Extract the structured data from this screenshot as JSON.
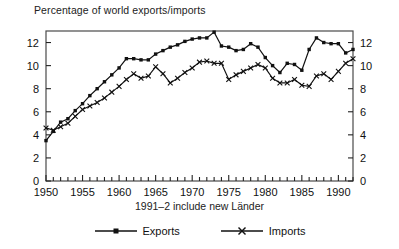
{
  "chart_data": {
    "type": "line",
    "title": "Percentage of world exports/imports",
    "subtitle": "1991–2 include new Länder",
    "xlabel": "",
    "ylabel": "",
    "xlim": [
      1950,
      1992
    ],
    "ylim": [
      0,
      13
    ],
    "grid": false,
    "legend_position": "bottom",
    "dual_y_axis": true,
    "x": [
      1950,
      1951,
      1952,
      1953,
      1954,
      1955,
      1956,
      1957,
      1958,
      1959,
      1960,
      1961,
      1962,
      1963,
      1964,
      1965,
      1966,
      1967,
      1968,
      1969,
      1970,
      1971,
      1972,
      1973,
      1974,
      1975,
      1976,
      1977,
      1978,
      1979,
      1980,
      1981,
      1982,
      1983,
      1984,
      1985,
      1986,
      1987,
      1988,
      1989,
      1990,
      1991,
      1992
    ],
    "x_tick_labels": [
      "1950",
      "1955",
      "1960",
      "1965",
      "1970",
      "1975",
      "1980",
      "1985",
      "1990"
    ],
    "x_tick_values": [
      1950,
      1955,
      1960,
      1965,
      1970,
      1975,
      1980,
      1985,
      1990
    ],
    "y_tick_labels": [
      "0",
      "2",
      "4",
      "6",
      "8",
      "10",
      "12"
    ],
    "y_tick_values": [
      0,
      2,
      4,
      6,
      8,
      10,
      12
    ],
    "series": [
      {
        "name": "Exports",
        "marker": "square",
        "color": "#111111",
        "values": [
          3.5,
          4.3,
          5.1,
          5.4,
          6.1,
          6.7,
          7.4,
          8.0,
          8.6,
          9.2,
          9.8,
          10.6,
          10.6,
          10.5,
          10.5,
          11.0,
          11.3,
          11.6,
          11.8,
          12.1,
          12.3,
          12.4,
          12.4,
          12.9,
          11.7,
          11.6,
          11.3,
          11.4,
          11.9,
          11.6,
          10.7,
          10.0,
          9.4,
          10.2,
          10.1,
          9.6,
          11.4,
          12.4,
          12.0,
          11.9,
          11.9,
          11.1,
          11.4
        ]
      },
      {
        "name": "Imports",
        "marker": "cross",
        "color": "#111111",
        "values": [
          4.6,
          4.4,
          4.7,
          5.0,
          5.6,
          6.2,
          6.5,
          6.8,
          7.2,
          7.7,
          8.2,
          8.8,
          9.3,
          8.9,
          9.1,
          9.9,
          9.3,
          8.5,
          8.9,
          9.4,
          9.8,
          10.3,
          10.4,
          10.2,
          10.2,
          8.8,
          9.2,
          9.5,
          9.8,
          10.1,
          9.8,
          8.9,
          8.5,
          8.5,
          8.8,
          8.3,
          8.2,
          9.1,
          9.3,
          8.8,
          9.5,
          10.2,
          10.6
        ]
      }
    ]
  },
  "legend": {
    "entries": [
      {
        "label": "Exports"
      },
      {
        "label": "Imports"
      }
    ]
  }
}
